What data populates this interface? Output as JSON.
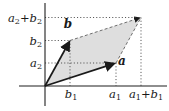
{
  "figure": {
    "type": "vector-addition-parallelogram",
    "background": "#ffffff",
    "parallelogram_fill": "#dedede",
    "line_color": "#1a1a1a",
    "dash_color": "#6e6e6e",
    "guide_color": "#3a3a3a"
  },
  "labels": {
    "axis_y_sum": {
      "v1": "a",
      "s1": "2",
      "op": "+",
      "v2": "b",
      "s2": "2"
    },
    "axis_y_b": {
      "v": "b",
      "s": "2"
    },
    "axis_y_a": {
      "v": "a",
      "s": "2"
    },
    "axis_x_b": {
      "v": "b",
      "s": "1"
    },
    "axis_x_a": {
      "v": "a",
      "s": "1"
    },
    "axis_x_sum": {
      "v1": "a",
      "s1": "1",
      "op": "+",
      "v2": "b",
      "s2": "1"
    },
    "vector_a": "a",
    "vector_b": "b"
  }
}
